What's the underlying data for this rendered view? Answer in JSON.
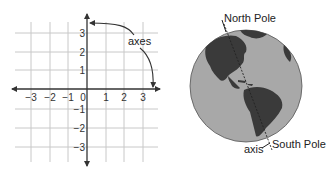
{
  "graph": {
    "x_ticks": [
      "−3",
      "−2",
      "−1",
      "0",
      "1",
      "2",
      "3"
    ],
    "y_ticks": [
      "3",
      "2",
      "1",
      "−1",
      "−2",
      "−3"
    ],
    "annotation": "axes",
    "x_range": [
      -3.5,
      3.5
    ],
    "y_range": [
      -3.5,
      3.5
    ]
  },
  "globe": {
    "north_label": "North Pole",
    "south_label": "South Pole",
    "axis_label": "axis"
  },
  "colors": {
    "grid": "#c8c8c8",
    "axis": "#333333",
    "ocean": "#a8a8a8",
    "land": "#3a3a3a"
  }
}
